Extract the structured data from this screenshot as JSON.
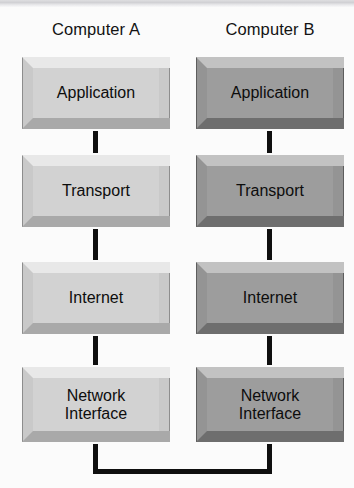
{
  "diagram": {
    "columns": [
      {
        "id": "computer-a",
        "title": "Computer A",
        "shade": "light",
        "face_color": "#d2d2d2",
        "layers": [
          {
            "id": "application",
            "label": "Application"
          },
          {
            "id": "transport",
            "label": "Transport"
          },
          {
            "id": "internet",
            "label": "Internet"
          },
          {
            "id": "network-interface",
            "label": "Network\nInterface"
          }
        ]
      },
      {
        "id": "computer-b",
        "title": "Computer B",
        "shade": "dark",
        "face_color": "#9d9d9d",
        "layers": [
          {
            "id": "application",
            "label": "Application"
          },
          {
            "id": "transport",
            "label": "Transport"
          },
          {
            "id": "internet",
            "label": "Internet"
          },
          {
            "id": "network-interface",
            "label": "Network\nInterface"
          }
        ]
      }
    ],
    "connectors": {
      "vertical_label": "stack-link",
      "network_link_label": "network-medium-link",
      "line_color": "#0f0f0f"
    },
    "background_color": "#fbfbfb"
  }
}
